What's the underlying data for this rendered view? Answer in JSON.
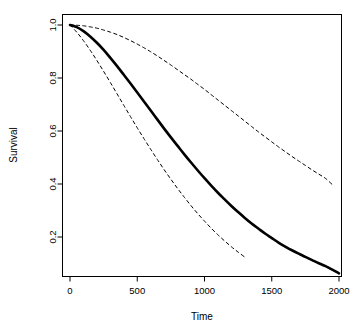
{
  "chart_data": {
    "type": "line",
    "title": "",
    "subtitle": "",
    "xlabel": "Time",
    "ylabel": "Survival",
    "xlim": [
      0,
      2000
    ],
    "ylim": [
      0.0,
      1.04
    ],
    "grid": false,
    "legend": null,
    "xticks": [
      0,
      500,
      1000,
      1500,
      2000
    ],
    "xticklabels": [
      "0",
      "500",
      "1000",
      "1500",
      "2000"
    ],
    "yticks": [
      0.2,
      0.4,
      0.6,
      0.8,
      1.0
    ],
    "yticklabels": [
      "0.2",
      "0.4",
      "0.6",
      "0.8",
      "1.0"
    ],
    "series": [
      {
        "name": "Survival estimate",
        "style": "solid",
        "color": "#000000",
        "linewidth": 2.6,
        "x": [
          0,
          50,
          100,
          150,
          200,
          250,
          300,
          350,
          400,
          450,
          500,
          550,
          600,
          650,
          700,
          750,
          800,
          850,
          900,
          950,
          1000,
          1050,
          1100,
          1150,
          1200,
          1250,
          1300,
          1350,
          1400,
          1450,
          1500,
          1550,
          1600,
          1650,
          1700,
          1750,
          1800,
          1850,
          1900,
          1950,
          2000
        ],
        "values": [
          1.0,
          0.992,
          0.977,
          0.957,
          0.933,
          0.906,
          0.876,
          0.845,
          0.812,
          0.779,
          0.745,
          0.711,
          0.677,
          0.643,
          0.609,
          0.576,
          0.544,
          0.512,
          0.481,
          0.451,
          0.422,
          0.394,
          0.367,
          0.342,
          0.317,
          0.294,
          0.272,
          0.251,
          0.232,
          0.213,
          0.196,
          0.179,
          0.164,
          0.15,
          0.137,
          0.125,
          0.113,
          0.101,
          0.09,
          0.077,
          0.063
        ]
      },
      {
        "name": "Upper confidence limit",
        "style": "dashed",
        "color": "#000000",
        "linewidth": 1.0,
        "x": [
          0,
          50,
          100,
          150,
          200,
          250,
          300,
          350,
          400,
          450,
          500,
          550,
          600,
          650,
          700,
          750,
          800,
          850,
          900,
          950,
          1000,
          1050,
          1100,
          1150,
          1200,
          1250,
          1300,
          1350,
          1400,
          1450,
          1500,
          1550,
          1600,
          1650,
          1700,
          1750,
          1800,
          1850,
          1900,
          1950
        ],
        "values": [
          1.0,
          0.999,
          0.997,
          0.993,
          0.988,
          0.981,
          0.973,
          0.964,
          0.953,
          0.941,
          0.928,
          0.914,
          0.899,
          0.883,
          0.866,
          0.849,
          0.831,
          0.813,
          0.795,
          0.776,
          0.757,
          0.737,
          0.717,
          0.697,
          0.677,
          0.657,
          0.637,
          0.617,
          0.597,
          0.578,
          0.559,
          0.54,
          0.522,
          0.504,
          0.487,
          0.47,
          0.453,
          0.437,
          0.421,
          0.398
        ]
      },
      {
        "name": "Lower confidence limit",
        "style": "dashed",
        "color": "#000000",
        "linewidth": 1.0,
        "x": [
          0,
          50,
          100,
          150,
          200,
          250,
          300,
          350,
          400,
          450,
          500,
          550,
          600,
          650,
          700,
          750,
          800,
          850,
          900,
          950,
          1000,
          1050,
          1100,
          1150,
          1200,
          1250,
          1300
        ],
        "values": [
          1.0,
          0.973,
          0.941,
          0.905,
          0.866,
          0.825,
          0.783,
          0.74,
          0.697,
          0.654,
          0.612,
          0.571,
          0.531,
          0.492,
          0.454,
          0.418,
          0.383,
          0.35,
          0.318,
          0.288,
          0.26,
          0.233,
          0.208,
          0.185,
          0.163,
          0.143,
          0.124
        ]
      }
    ],
    "annotations": []
  },
  "axes": {
    "x_axis_label": "Time",
    "y_axis_label": "Survival"
  }
}
